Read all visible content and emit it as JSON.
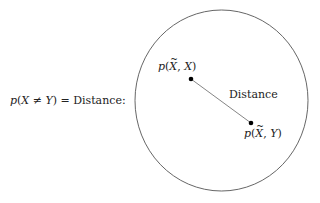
{
  "equation": {
    "p": "p",
    "open": "(",
    "x": "X",
    "neq": " ≠ ",
    "y": "Y",
    "close": ")",
    "equals_text": " = Distance:"
  },
  "points": [
    {
      "id": "p_xtilde_x",
      "p": "p",
      "open": "(",
      "a": "X",
      "sep": ", ",
      "b": "X",
      "close": ")",
      "cx": 191,
      "cy": 79
    },
    {
      "id": "p_xtilde_y",
      "p": "p",
      "open": "(",
      "a": "X",
      "sep": ", ",
      "b": "Y",
      "close": ")",
      "cx": 251,
      "cy": 123
    }
  ],
  "distance_label": "Distance",
  "circle": {
    "cx": 221.5,
    "cy": 100.5,
    "rx": 86.5,
    "ry": 90.5,
    "stroke": "#555555"
  },
  "line_color": "#666666",
  "dot_color": "#000000"
}
